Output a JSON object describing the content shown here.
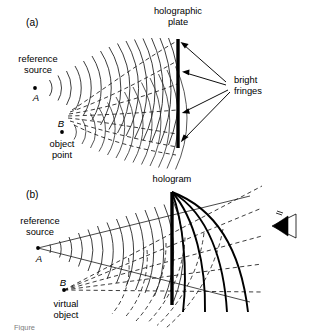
{
  "figure": {
    "kind": "physics-diagram",
    "background_color": "#ffffff",
    "ink_color": "#000000"
  },
  "panel_a": {
    "panel_label": "(a)",
    "title_line1": "holographic",
    "title_line2": "plate",
    "reference_source_line1": "reference",
    "reference_source_line2": "source",
    "point_a": "A",
    "point_b": "B",
    "object_point_line1": "object",
    "object_point_line2": "point",
    "fringes_line1": "bright",
    "fringes_line2": "fringes"
  },
  "panel_b": {
    "panel_label": "(b)",
    "title": "hologram",
    "reference_source_line1": "reference",
    "reference_source_line2": "source",
    "point_a": "A",
    "point_b": "B",
    "virtual_object_line1": "virtual",
    "virtual_object_line2": "object",
    "observer_icon": "eye-icon"
  },
  "caption": {
    "text": "Figure"
  },
  "geometry": {
    "panel_a": {
      "source_a": [
        35,
        88
      ],
      "source_b": [
        62,
        132
      ],
      "plate_x": 178,
      "plate_top": 39,
      "plate_bottom": 148,
      "fringe_arrow_origin": [
        228,
        85
      ],
      "fringe_arrow_targets_y": [
        45,
        72,
        112,
        140
      ]
    },
    "panel_b": {
      "source_a": [
        38,
        248
      ],
      "source_b": [
        64,
        290
      ],
      "hologram_x": 172,
      "hologram_top": 192,
      "hologram_bottom": 305,
      "observer_icon_center": [
        283,
        224
      ]
    }
  }
}
